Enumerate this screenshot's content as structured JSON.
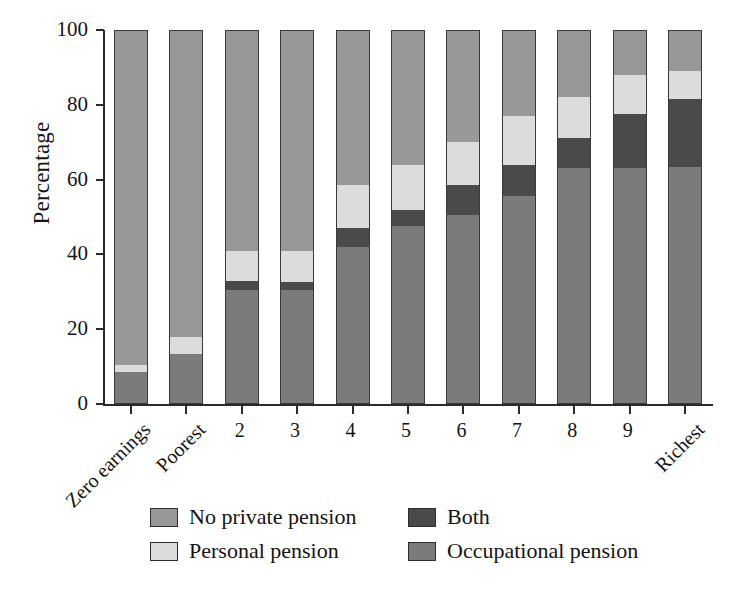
{
  "chart_data": {
    "type": "bar",
    "subtype": "stacked-bar-100",
    "title": "",
    "xlabel": "",
    "ylabel": "Percentage",
    "ylim": [
      0,
      100
    ],
    "yticks": [
      0,
      20,
      40,
      60,
      80,
      100
    ],
    "ytick_labels": [
      "0",
      "20",
      "40",
      "60",
      "80",
      "100"
    ],
    "grid": false,
    "legend_position": "bottom",
    "categories": [
      "Zero earnings",
      "Poorest",
      "2",
      "3",
      "4",
      "5",
      "6",
      "7",
      "8",
      "9",
      "Richest"
    ],
    "series": [
      {
        "name": "Occupational pension",
        "color": "#7b7b7b",
        "values": [
          8.5,
          13.5,
          30.5,
          30.5,
          42.0,
          47.5,
          50.5,
          55.5,
          63.0,
          63.0,
          63.5
        ]
      },
      {
        "name": "Both",
        "color": "#4a4a4a",
        "values": [
          0.0,
          0.0,
          2.5,
          2.0,
          5.0,
          4.5,
          8.0,
          8.5,
          8.0,
          14.5,
          18.0
        ]
      },
      {
        "name": "Personal pension",
        "color": "#dcdcdc",
        "values": [
          2.0,
          4.5,
          8.0,
          8.5,
          11.5,
          12.0,
          11.5,
          13.0,
          11.0,
          10.5,
          7.5
        ]
      },
      {
        "name": "No private pension",
        "color": "#989898",
        "values": [
          89.5,
          82.0,
          59.0,
          59.0,
          41.5,
          36.0,
          30.0,
          23.0,
          18.0,
          12.0,
          11.0
        ]
      }
    ]
  },
  "axes": {
    "y_label": "Percentage"
  },
  "legend": {
    "entries": [
      {
        "label": "No private pension",
        "color": "#989898"
      },
      {
        "label": "Both",
        "color": "#4a4a4a"
      },
      {
        "label": "Personal pension",
        "color": "#dcdcdc"
      },
      {
        "label": "Occupational pension",
        "color": "#7b7b7b"
      }
    ]
  }
}
